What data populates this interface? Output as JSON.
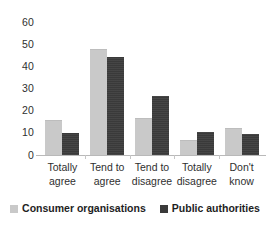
{
  "chart_data": {
    "type": "bar",
    "title": "",
    "subtitle": "",
    "xlabel": "",
    "ylabel": "",
    "ylim": [
      0,
      60
    ],
    "yticks": [
      "0",
      "10",
      "20",
      "30",
      "40",
      "50",
      "60"
    ],
    "grid": false,
    "legend_position": "bottom",
    "categories": [
      "Totally agree",
      "Tend to agree",
      "Tend to disagree",
      "Totally disagree",
      "Don't know"
    ],
    "category_lines": [
      [
        "Totally",
        "agree"
      ],
      [
        "Tend to",
        "agree"
      ],
      [
        "Tend to",
        "disagree"
      ],
      [
        "Totally",
        "disagree"
      ],
      [
        "Don't",
        "know"
      ]
    ],
    "series": [
      {
        "name": "Consumer organisations",
        "color": "#c9c9c9",
        "values": [
          16,
          48,
          17,
          7,
          12.5
        ]
      },
      {
        "name": "Public authorities",
        "color": "#3a3a3a",
        "values": [
          10,
          44.5,
          27,
          10.5,
          9.5
        ]
      }
    ]
  },
  "legend": {
    "entries": [
      {
        "label": "Consumer organisations",
        "swatch": "light-gray-square-icon"
      },
      {
        "label": "Public authorities",
        "swatch": "dark-gray-square-icon"
      }
    ]
  },
  "axis": {
    "y_tick_0": "0",
    "y_tick_1": "10",
    "y_tick_2": "20",
    "y_tick_3": "30",
    "y_tick_4": "40",
    "y_tick_5": "50",
    "y_tick_6": "60"
  }
}
